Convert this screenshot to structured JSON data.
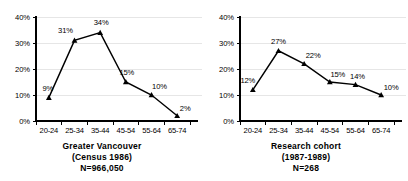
{
  "figure": {
    "background_color": "#ffffff",
    "line_color": "#000000",
    "grid_color": "#dcdcdc"
  },
  "chart_data": [
    {
      "type": "line",
      "panel": "left",
      "title": "Greater Vancouver",
      "subtitle": "(Census 1986)",
      "n_label": "N=966,050",
      "xlabel": "",
      "ylabel": "",
      "categories": [
        "20-24",
        "25-34",
        "35-44",
        "45-54",
        "55-64",
        "65-74"
      ],
      "values": [
        9,
        31,
        34,
        15,
        10,
        2
      ],
      "point_labels": [
        "9%",
        "31%",
        "34%",
        "15%",
        "10%",
        "2%"
      ],
      "ylim": [
        0,
        40
      ],
      "ytick_labels": [
        "0%",
        "10%",
        "20%",
        "30%",
        "40%"
      ],
      "ytick_values": [
        0,
        10,
        20,
        30,
        40
      ],
      "grid": true,
      "legend": "none",
      "marker": "triangle"
    },
    {
      "type": "line",
      "panel": "right",
      "title": "Research cohort",
      "subtitle": "(1987-1989)",
      "n_label": "N=268",
      "xlabel": "",
      "ylabel": "",
      "categories": [
        "20-24",
        "25-34",
        "35-44",
        "45-54",
        "55-64",
        "65-74"
      ],
      "values": [
        12,
        27,
        22,
        15,
        14,
        10
      ],
      "point_labels": [
        "12%",
        "27%",
        "22%",
        "15%",
        "14%",
        "10%"
      ],
      "ylim": [
        0,
        40
      ],
      "ytick_labels": [
        "0%",
        "10%",
        "20%",
        "30%",
        "40%"
      ],
      "ytick_values": [
        0,
        10,
        20,
        30,
        40
      ],
      "grid": true,
      "legend": "none",
      "marker": "triangle"
    }
  ]
}
